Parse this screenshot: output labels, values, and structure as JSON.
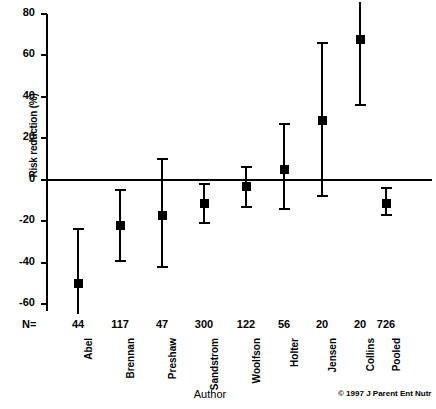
{
  "chart_data": {
    "type": "scatter",
    "title": "",
    "xlabel": "Author",
    "ylabel": "Risk reduction (%)",
    "ylim": [
      -60,
      80
    ],
    "yticks": [
      80,
      60,
      40,
      20,
      0,
      -20,
      -40,
      -60
    ],
    "ytick_labels": [
      "80",
      "60",
      "40",
      "20",
      "0",
      "-20",
      "-40",
      "-60"
    ],
    "grid": false,
    "legend": null,
    "zero_reference_line": 0,
    "n_row_label": "N=",
    "categories": [
      "Abel",
      "Brennan",
      "Preshaw",
      "Sandstrom",
      "Woolfson",
      "Holter",
      "Jensen",
      "Collins",
      "Pooled"
    ],
    "n_values": [
      "44",
      "117",
      "47",
      "300",
      "122",
      "56",
      "20",
      "20",
      "726"
    ],
    "points": [
      {
        "author": "Abel",
        "n": "44",
        "estimate": -50,
        "low": -60,
        "high": -24,
        "low_clipped": true,
        "high_clipped": false
      },
      {
        "author": "Brennan",
        "n": "117",
        "estimate": -22,
        "low": -39,
        "high": -5,
        "low_clipped": false,
        "high_clipped": false
      },
      {
        "author": "Preshaw",
        "n": "47",
        "estimate": -17,
        "low": -42,
        "high": 10,
        "low_clipped": false,
        "high_clipped": false
      },
      {
        "author": "Sandstrom",
        "n": "300",
        "estimate": -11,
        "low": -21,
        "high": -2,
        "low_clipped": false,
        "high_clipped": false
      },
      {
        "author": "Woolfson",
        "n": "122",
        "estimate": -3,
        "low": -13,
        "high": 6,
        "low_clipped": false,
        "high_clipped": false
      },
      {
        "author": "Holter",
        "n": "56",
        "estimate": 5,
        "low": -14,
        "high": 27,
        "low_clipped": false,
        "high_clipped": false
      },
      {
        "author": "Jensen",
        "n": "20",
        "estimate": 29,
        "low": -8,
        "high": 66,
        "low_clipped": false,
        "high_clipped": false
      },
      {
        "author": "Collins",
        "n": "20",
        "estimate": 68,
        "low": 36,
        "high": 80,
        "low_clipped": false,
        "high_clipped": true
      },
      {
        "author": "Pooled",
        "n": "726",
        "estimate": -11,
        "low": -17,
        "high": -4,
        "low_clipped": false,
        "high_clipped": false
      }
    ]
  },
  "footer": {
    "copyright": "© 1997 J Parent Ent Nutr"
  },
  "colors": {
    "ink": "#000000",
    "background": "#ffffff"
  }
}
